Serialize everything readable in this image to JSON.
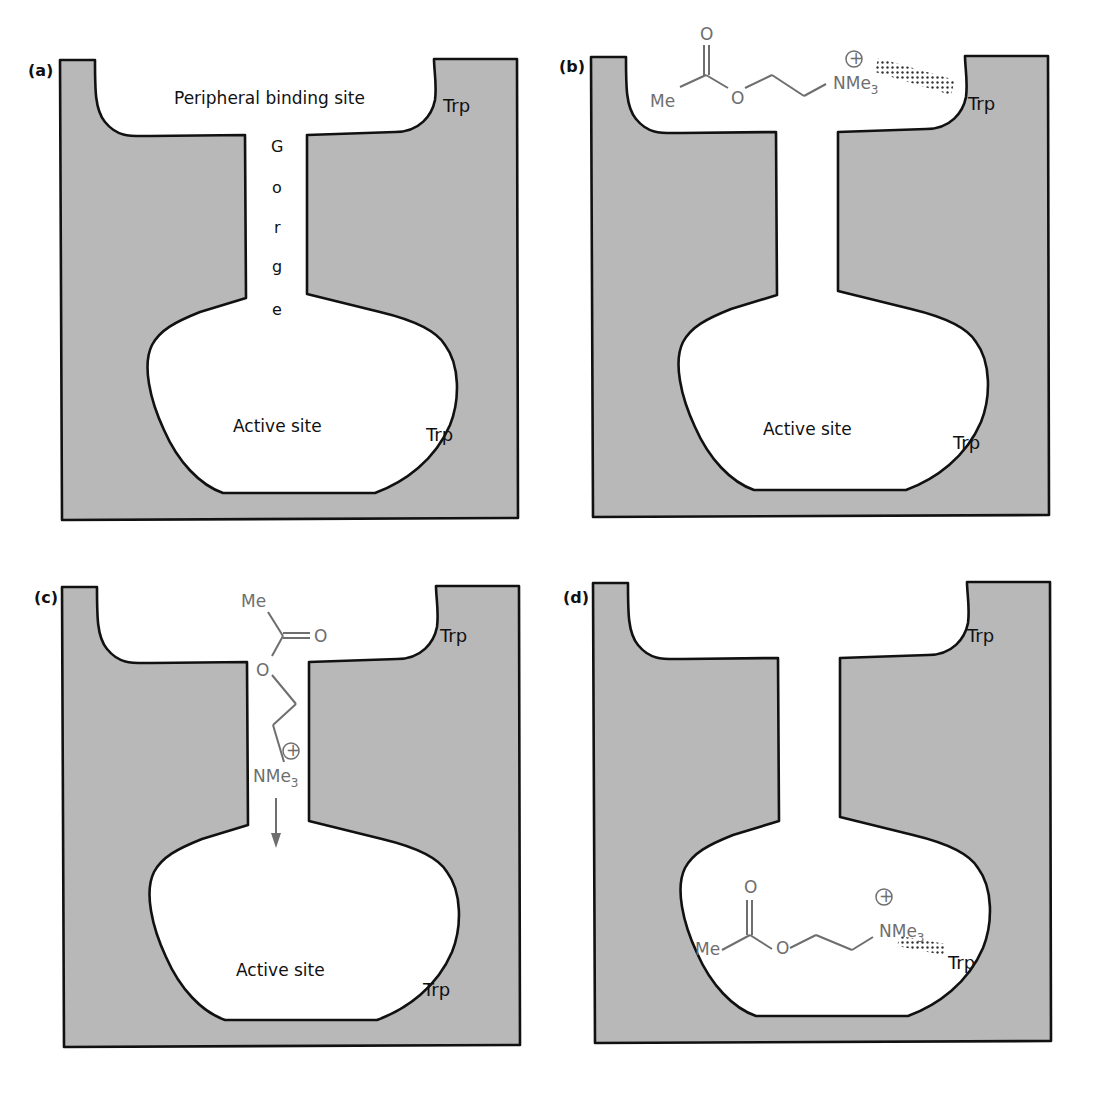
{
  "figure": {
    "colors": {
      "protein_fill": "#b8b8b8",
      "outline": "#111111",
      "molecule": "#6e6e6e",
      "background": "#ffffff"
    },
    "panels": [
      {
        "id": "a",
        "label": "(a)",
        "peripheral_label": "Peripheral binding site",
        "gorge_letters": [
          "G",
          "o",
          "r",
          "g",
          "e"
        ],
        "active_label": "Active site",
        "trp_top": "Trp",
        "trp_bottom": "Trp"
      },
      {
        "id": "b",
        "label": "(b)",
        "active_label": "Active site",
        "trp_top": "Trp",
        "trp_bottom": "Trp",
        "molecule": {
          "carbonyl_o": "O",
          "methyl": "Me",
          "ester_o": "O",
          "amine": "NMe",
          "amine_sub": "3",
          "charge": "+",
          "interaction": "cation-pi (dotted) with top Trp"
        }
      },
      {
        "id": "c",
        "label": "(c)",
        "active_label": "Active site",
        "trp_top": "Trp",
        "trp_bottom": "Trp",
        "molecule": {
          "methyl": "Me",
          "carbonyl_o": "O",
          "ester_o": "O",
          "amine": "NMe",
          "amine_sub": "3",
          "charge": "+",
          "arrow": "down"
        }
      },
      {
        "id": "d",
        "label": "(d)",
        "trp_top": "Trp",
        "trp_bottom": "Trp",
        "molecule": {
          "carbonyl_o": "O",
          "methyl": "Me",
          "ester_o": "O",
          "amine": "NMe",
          "amine_sub": "3",
          "charge": "+",
          "interaction": "cation-pi (dotted) with bottom Trp"
        }
      }
    ]
  }
}
